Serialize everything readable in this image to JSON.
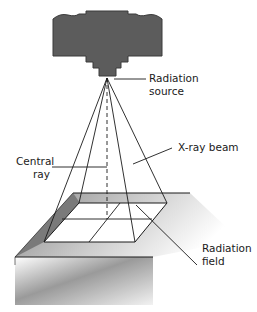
{
  "diagram": {
    "type": "xray-beam-geometry",
    "labels": {
      "radiation_source_line1": "Radiation",
      "radiation_source_line2": "source",
      "xray_beam": "X-ray beam",
      "central_ray_line1": "Central",
      "central_ray_line2": "ray",
      "radiation_field_line1": "Radiation",
      "radiation_field_line2": "field"
    },
    "colors": {
      "tube": "#5c5c5c",
      "lines": "#1a1a1a",
      "table_shade": "#7a7a7a"
    }
  }
}
